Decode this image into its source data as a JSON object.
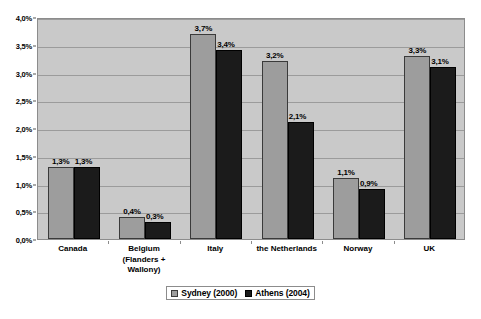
{
  "chart_data": {
    "type": "bar",
    "title": "",
    "subtitle": "",
    "xlabel": "",
    "ylabel": "",
    "ylim": [
      0,
      4
    ],
    "grid": true,
    "legend_position": "bottom",
    "y_ticks": [
      "0,0%",
      "0,5%",
      "1,0%",
      "1,5%",
      "2,0%",
      "2,5%",
      "3,0%",
      "3,5%",
      "4,0%"
    ],
    "y_tick_values": [
      0,
      0.5,
      1.0,
      1.5,
      2.0,
      2.5,
      3.0,
      3.5,
      4.0
    ],
    "categories": [
      "Canada",
      "Belgium (Flanders + Wallony)",
      "Italy",
      "the Netherlands",
      "Norway",
      "UK"
    ],
    "category_lines": [
      [
        "Canada"
      ],
      [
        "Belgium",
        "(Flanders +",
        "Wallony)"
      ],
      [
        "Italy"
      ],
      [
        "the Netherlands"
      ],
      [
        "Norway"
      ],
      [
        "UK"
      ]
    ],
    "series": [
      {
        "name": "Sydney (2000)",
        "color": "#9d9d9d",
        "values": [
          1.3,
          0.4,
          3.7,
          3.2,
          1.1,
          3.3
        ],
        "labels": [
          "1,3%",
          "0,4%",
          "3,7%",
          "3,2%",
          "1,1%",
          "3,3%"
        ]
      },
      {
        "name": "Athens (2004)",
        "color": "#1b1b1b",
        "values": [
          1.3,
          0.3,
          3.4,
          2.1,
          0.9,
          3.1
        ],
        "labels": [
          "1,3%",
          "0,3%",
          "3,4%",
          "2,1%",
          "0,9%",
          "3,1%"
        ]
      }
    ]
  },
  "legend": {
    "entries": [
      {
        "label": "Sydney (2000)",
        "color": "#9d9d9d"
      },
      {
        "label": "Athens (2004)",
        "color": "#1b1b1b"
      }
    ]
  },
  "colors": {
    "plot_background": "#c9c9c9",
    "gridline": "#9b9b9b",
    "series_0": "#9d9d9d",
    "series_1": "#1b1b1b",
    "page_background": "#ffffff"
  }
}
